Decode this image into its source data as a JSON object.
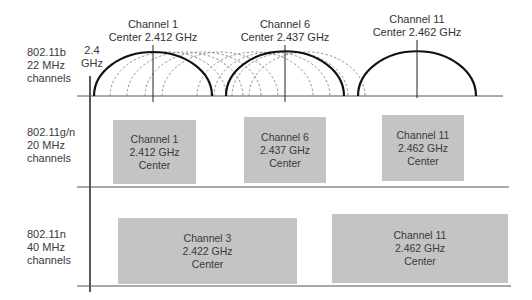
{
  "rows": [
    {
      "label_lines": [
        "802.11b",
        "22 MHz",
        "channels"
      ]
    },
    {
      "label_lines": [
        "802.11g/n",
        "20 MHz",
        "channels"
      ]
    },
    {
      "label_lines": [
        "802.11n",
        "40 MHz",
        "channels"
      ]
    }
  ],
  "axis": {
    "start_label_lines": [
      "2.4",
      "GHz"
    ]
  },
  "b_channels": [
    {
      "title": "Channel 1",
      "center": "Center 2.412 GHz"
    },
    {
      "title": "Channel 6",
      "center": "Center 2.437 GHz"
    },
    {
      "title": "Channel 11",
      "center": "Center 2.462 GHz"
    }
  ],
  "gn_channels": [
    {
      "lines": [
        "Channel 1",
        "2.412 GHz",
        "Center"
      ]
    },
    {
      "lines": [
        "Channel 6",
        "2.437 GHz",
        "Center"
      ]
    },
    {
      "lines": [
        "Channel 11",
        "2.462 GHz",
        "Center"
      ]
    }
  ],
  "n40_channels": [
    {
      "lines": [
        "Channel 3",
        "2.422 GHz",
        "Center"
      ]
    },
    {
      "lines": [
        "Channel 11",
        "2.462 GHz",
        "Center"
      ]
    }
  ],
  "colors": {
    "box_fill": "#c4c4c4",
    "line": "#111111",
    "dashed": "#888888"
  }
}
